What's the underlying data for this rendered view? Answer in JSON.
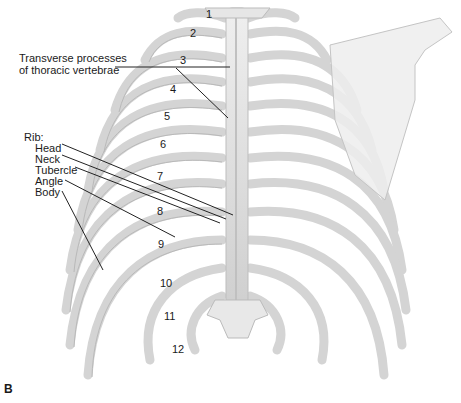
{
  "figure": {
    "panel_letter": "B",
    "view": "posterior view of thoracic cage",
    "colors": {
      "bone": "#e4e4e4",
      "bone_shade": "#c8c8c8",
      "bone_outline": "#b0b0b0",
      "leader": "#222222",
      "scapula": "#ececec"
    }
  },
  "labels": {
    "transverse": {
      "line1": "Transverse processes",
      "line2": "of thoracic vertebrae"
    },
    "rib_header": "Rib:",
    "rib_parts": [
      "Head",
      "Neck",
      "Tubercle",
      "Angle",
      "Body"
    ]
  },
  "rib_numbers": [
    "1",
    "2",
    "3",
    "4",
    "5",
    "6",
    "7",
    "8",
    "9",
    "10",
    "11",
    "12"
  ]
}
